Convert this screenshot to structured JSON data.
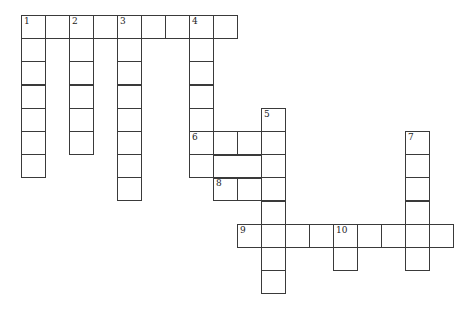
{
  "puzzle": {
    "type": "crossword",
    "cell_w": 24,
    "cell_h": 23.2,
    "origin_x": 21,
    "origin_y": 15,
    "cells": [
      [
        0,
        0,
        "1"
      ],
      [
        1,
        0,
        ""
      ],
      [
        2,
        0,
        "2"
      ],
      [
        3,
        0,
        ""
      ],
      [
        4,
        0,
        "3"
      ],
      [
        5,
        0,
        ""
      ],
      [
        6,
        0,
        ""
      ],
      [
        7,
        0,
        "4"
      ],
      [
        8,
        0,
        ""
      ],
      [
        0,
        1,
        ""
      ],
      [
        0,
        2,
        ""
      ],
      [
        0,
        3,
        ""
      ],
      [
        0,
        4,
        ""
      ],
      [
        0,
        5,
        ""
      ],
      [
        0,
        6,
        ""
      ],
      [
        2,
        1,
        ""
      ],
      [
        2,
        2,
        ""
      ],
      [
        2,
        3,
        ""
      ],
      [
        2,
        4,
        ""
      ],
      [
        2,
        5,
        ""
      ],
      [
        4,
        1,
        ""
      ],
      [
        4,
        2,
        ""
      ],
      [
        4,
        3,
        ""
      ],
      [
        4,
        4,
        ""
      ],
      [
        4,
        5,
        ""
      ],
      [
        4,
        6,
        ""
      ],
      [
        4,
        7,
        ""
      ],
      [
        7,
        1,
        ""
      ],
      [
        7,
        2,
        ""
      ],
      [
        7,
        3,
        ""
      ],
      [
        7,
        4,
        ""
      ],
      [
        7,
        5,
        "6"
      ],
      [
        7,
        6,
        ""
      ],
      [
        8,
        5,
        ""
      ],
      [
        9,
        5,
        ""
      ],
      [
        10,
        4,
        "5"
      ],
      [
        10,
        5,
        ""
      ],
      [
        10,
        6,
        ""
      ],
      [
        10,
        7,
        ""
      ],
      [
        10,
        8,
        ""
      ],
      [
        10,
        9,
        ""
      ],
      [
        10,
        10,
        ""
      ],
      [
        10,
        11,
        ""
      ],
      [
        8,
        7,
        "8"
      ],
      [
        9,
        7,
        ""
      ],
      [
        9,
        9,
        "9"
      ],
      [
        11,
        9,
        ""
      ],
      [
        12,
        9,
        ""
      ],
      [
        13,
        9,
        "10"
      ],
      [
        14,
        9,
        ""
      ],
      [
        15,
        9,
        ""
      ],
      [
        16,
        9,
        ""
      ],
      [
        17,
        9,
        ""
      ],
      [
        13,
        10,
        ""
      ],
      [
        16,
        5,
        "7"
      ],
      [
        16,
        6,
        ""
      ],
      [
        16,
        7,
        ""
      ],
      [
        16,
        8,
        ""
      ],
      [
        16,
        10,
        ""
      ]
    ],
    "clue_numbers": [
      "1",
      "2",
      "3",
      "4",
      "5",
      "6",
      "7",
      "8",
      "9",
      "10"
    ]
  }
}
